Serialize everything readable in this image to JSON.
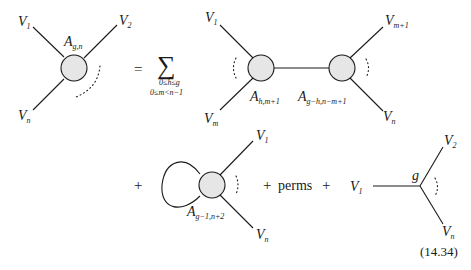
{
  "equation": {
    "number": "(14.34)",
    "lhs": {
      "vertex_label": "A",
      "vertex_sub": "g,n",
      "legs": [
        {
          "name": "V",
          "sub": "1"
        },
        {
          "name": "V",
          "sub": "2"
        },
        {
          "name": "V",
          "sub": "n"
        }
      ]
    },
    "equals": "=",
    "sum": {
      "symbol": "∑",
      "limit_line1": "0≤h≤g",
      "limit_line2": "0≤m<n−1"
    },
    "term1": {
      "left_vertex_label": "A",
      "left_vertex_sub": "h,m+1",
      "right_vertex_label": "A",
      "right_vertex_sub": "g−h,n−m+1",
      "legs": [
        {
          "name": "V",
          "sub": "1"
        },
        {
          "name": "V",
          "sub": "m"
        },
        {
          "name": "V",
          "sub": "m+1"
        },
        {
          "name": "V",
          "sub": "n"
        }
      ]
    },
    "plus1": "+",
    "term2": {
      "vertex_label": "A",
      "vertex_sub": "g−1,n+2",
      "legs": [
        {
          "name": "V",
          "sub": "1"
        },
        {
          "name": "V",
          "sub": "n"
        }
      ]
    },
    "plus2": "+",
    "perms": "perms",
    "plus3": "+",
    "term3": {
      "vertex_label": "g",
      "legs": [
        {
          "name": "V",
          "sub": "1"
        },
        {
          "name": "V",
          "sub": "2"
        },
        {
          "name": "V",
          "sub": "n"
        }
      ]
    }
  }
}
